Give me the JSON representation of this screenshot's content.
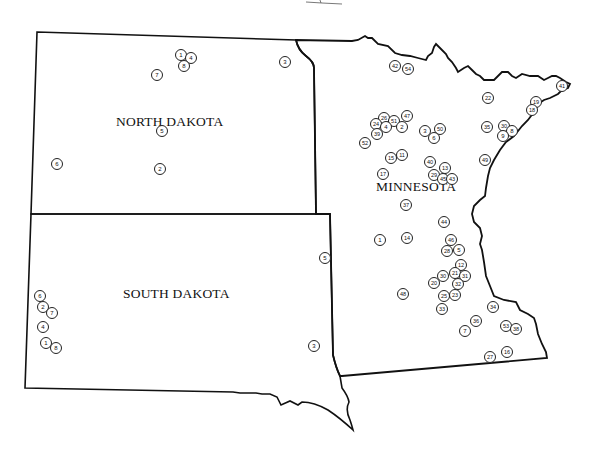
{
  "map": {
    "states": [
      {
        "id": "north-dakota",
        "label": "NORTH DAKOTA",
        "label_x": 116,
        "label_y": 114
      },
      {
        "id": "south-dakota",
        "label": "SOUTH DAKOTA",
        "label_x": 123,
        "label_y": 286
      },
      {
        "id": "minnesota",
        "label": "MINNESOTA",
        "label_x": 376,
        "label_y": 179
      }
    ],
    "border_color": "#111111",
    "marker_color": "#222222"
  },
  "markers": {
    "north_dakota": [
      {
        "n": "1",
        "x": 181,
        "y": 55
      },
      {
        "n": "4",
        "x": 191,
        "y": 58
      },
      {
        "n": "8",
        "x": 184,
        "y": 66
      },
      {
        "n": "7",
        "x": 157,
        "y": 75
      },
      {
        "n": "3",
        "x": 285,
        "y": 62
      },
      {
        "n": "5",
        "x": 162,
        "y": 131
      },
      {
        "n": "6",
        "x": 57,
        "y": 164
      },
      {
        "n": "2",
        "x": 160,
        "y": 169
      }
    ],
    "south_dakota": [
      {
        "n": "5",
        "x": 325,
        "y": 258
      },
      {
        "n": "6",
        "x": 40,
        "y": 296
      },
      {
        "n": "2",
        "x": 43,
        "y": 307
      },
      {
        "n": "7",
        "x": 52,
        "y": 313
      },
      {
        "n": "4",
        "x": 43,
        "y": 327
      },
      {
        "n": "1",
        "x": 46,
        "y": 343
      },
      {
        "n": "8",
        "x": 56,
        "y": 348
      },
      {
        "n": "3",
        "x": 314,
        "y": 346
      }
    ],
    "minnesota": [
      {
        "n": "42",
        "x": 395,
        "y": 66
      },
      {
        "n": "54",
        "x": 408,
        "y": 69
      },
      {
        "n": "41",
        "x": 562,
        "y": 86
      },
      {
        "n": "22",
        "x": 488,
        "y": 98
      },
      {
        "n": "19",
        "x": 536,
        "y": 102
      },
      {
        "n": "18",
        "x": 532,
        "y": 110
      },
      {
        "n": "26",
        "x": 384,
        "y": 118
      },
      {
        "n": "47",
        "x": 407,
        "y": 116
      },
      {
        "n": "24",
        "x": 376,
        "y": 124
      },
      {
        "n": "51",
        "x": 394,
        "y": 121
      },
      {
        "n": "4",
        "x": 386,
        "y": 127
      },
      {
        "n": "2",
        "x": 402,
        "y": 127
      },
      {
        "n": "39",
        "x": 377,
        "y": 134
      },
      {
        "n": "3",
        "x": 425,
        "y": 131
      },
      {
        "n": "50",
        "x": 440,
        "y": 129
      },
      {
        "n": "6",
        "x": 434,
        "y": 138
      },
      {
        "n": "35",
        "x": 487,
        "y": 127
      },
      {
        "n": "30",
        "x": 504,
        "y": 126
      },
      {
        "n": "8",
        "x": 512,
        "y": 131
      },
      {
        "n": "9",
        "x": 503,
        "y": 136
      },
      {
        "n": "52",
        "x": 365,
        "y": 143
      },
      {
        "n": "15",
        "x": 391,
        "y": 158
      },
      {
        "n": "11",
        "x": 402,
        "y": 155
      },
      {
        "n": "40",
        "x": 430,
        "y": 162
      },
      {
        "n": "49",
        "x": 485,
        "y": 160
      },
      {
        "n": "13",
        "x": 445,
        "y": 168
      },
      {
        "n": "17",
        "x": 383,
        "y": 174
      },
      {
        "n": "29",
        "x": 434,
        "y": 175
      },
      {
        "n": "45",
        "x": 443,
        "y": 179
      },
      {
        "n": "43",
        "x": 452,
        "y": 179
      },
      {
        "n": "37",
        "x": 406,
        "y": 205
      },
      {
        "n": "44",
        "x": 444,
        "y": 222
      },
      {
        "n": "1",
        "x": 380,
        "y": 240
      },
      {
        "n": "14",
        "x": 407,
        "y": 238
      },
      {
        "n": "46",
        "x": 451,
        "y": 240
      },
      {
        "n": "28",
        "x": 447,
        "y": 251
      },
      {
        "n": "5",
        "x": 459,
        "y": 250
      },
      {
        "n": "12",
        "x": 461,
        "y": 265
      },
      {
        "n": "30",
        "x": 443,
        "y": 276
      },
      {
        "n": "21",
        "x": 455,
        "y": 273
      },
      {
        "n": "31",
        "x": 465,
        "y": 276
      },
      {
        "n": "20",
        "x": 434,
        "y": 283
      },
      {
        "n": "32",
        "x": 458,
        "y": 284
      },
      {
        "n": "48",
        "x": 403,
        "y": 294
      },
      {
        "n": "25",
        "x": 444,
        "y": 296
      },
      {
        "n": "23",
        "x": 455,
        "y": 295
      },
      {
        "n": "33",
        "x": 442,
        "y": 309
      },
      {
        "n": "34",
        "x": 493,
        "y": 307
      },
      {
        "n": "36",
        "x": 476,
        "y": 321
      },
      {
        "n": "7",
        "x": 465,
        "y": 331
      },
      {
        "n": "53",
        "x": 506,
        "y": 326
      },
      {
        "n": "38",
        "x": 516,
        "y": 329
      },
      {
        "n": "16",
        "x": 507,
        "y": 352
      },
      {
        "n": "27",
        "x": 490,
        "y": 357
      }
    ]
  }
}
